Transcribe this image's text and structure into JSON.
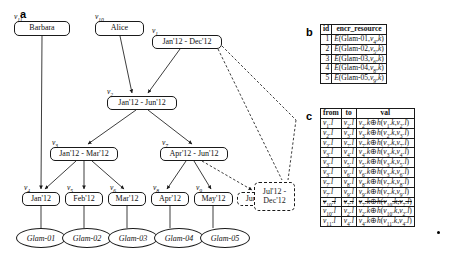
{
  "figure": {
    "panels": [
      "a",
      "b",
      "c"
    ]
  },
  "panel_a": {
    "letter": "a",
    "nodes": [
      {
        "id": "n-barbara",
        "label": "Barbara",
        "vlabel": "v",
        "vsub": "11",
        "x": 14,
        "y": 21,
        "w": 56,
        "h": 15,
        "style": "solid"
      },
      {
        "id": "n-alice",
        "label": "Alice",
        "vlabel": "v",
        "vsub": "10",
        "x": 95,
        "y": 21,
        "w": 49,
        "h": 15,
        "style": "solid"
      },
      {
        "id": "n-v1",
        "label": "Jan'12 - Dec'12",
        "vlabel": "v",
        "vsub": "1",
        "x": 152,
        "y": 35,
        "w": 70,
        "h": 14,
        "style": "solid"
      },
      {
        "id": "n-v2",
        "label": "Jan'12 - Jun'12",
        "vlabel": "v",
        "vsub": "2",
        "x": 107,
        "y": 96,
        "w": 70,
        "h": 14,
        "style": "solid"
      },
      {
        "id": "n-v3",
        "label": "Jan'12 - Mar'12",
        "vlabel": "v",
        "vsub": "3",
        "x": 50,
        "y": 147,
        "w": 68,
        "h": 14,
        "style": "solid"
      },
      {
        "id": "n-v7",
        "label": "Apr'12 - Jun'12",
        "vlabel": "v",
        "vsub": "7",
        "x": 160,
        "y": 147,
        "w": 68,
        "h": 14,
        "style": "solid"
      },
      {
        "id": "n-v4",
        "label": "Jan'12",
        "vlabel": "v",
        "vsub": "4",
        "x": 22,
        "y": 192,
        "w": 38,
        "h": 14,
        "style": "solid"
      },
      {
        "id": "n-v5",
        "label": "Feb'12",
        "vlabel": "v",
        "vsub": "5",
        "x": 65,
        "y": 192,
        "w": 38,
        "h": 14,
        "style": "solid"
      },
      {
        "id": "n-v6",
        "label": "Mar'12",
        "vlabel": "v",
        "vsub": "6",
        "x": 108,
        "y": 192,
        "w": 38,
        "h": 14,
        "style": "solid"
      },
      {
        "id": "n-v8",
        "label": "Apr'12",
        "vlabel": "v",
        "vsub": "8",
        "x": 151,
        "y": 192,
        "w": 38,
        "h": 14,
        "style": "solid"
      },
      {
        "id": "n-v9",
        "label": "May'12",
        "vlabel": "v",
        "vsub": "9",
        "x": 194,
        "y": 192,
        "w": 39,
        "h": 14,
        "style": "solid"
      },
      {
        "id": "n-jun",
        "label": "Jun'12",
        "vlabel": "",
        "vsub": "",
        "x": 237,
        "y": 192,
        "w": 38,
        "h": 14,
        "style": "dashed"
      },
      {
        "id": "n-jul-dec",
        "label": "Jul'12 - Dec'12",
        "vlabel": "",
        "vsub": "",
        "x": 254,
        "y": 182,
        "w": 41,
        "h": 29,
        "style": "dashed"
      }
    ],
    "resources": [
      {
        "id": "r1",
        "label": "Glam-01",
        "x": 16,
        "y": 228,
        "w": 50,
        "h": 20
      },
      {
        "id": "r2",
        "label": "Glam-02",
        "x": 62,
        "y": 228,
        "w": 50,
        "h": 20
      },
      {
        "id": "r3",
        "label": "Glam-03",
        "x": 108,
        "y": 228,
        "w": 50,
        "h": 20
      },
      {
        "id": "r4",
        "label": "Glam-04",
        "x": 154,
        "y": 228,
        "w": 50,
        "h": 20
      },
      {
        "id": "r5",
        "label": "Glam-05",
        "x": 200,
        "y": 228,
        "w": 50,
        "h": 20
      }
    ]
  },
  "panel_b": {
    "letter": "b",
    "title": "encr_resource table",
    "columns": [
      "id",
      "encr_resource"
    ],
    "rows": [
      {
        "id": "1",
        "fn": "E",
        "res": "Glam-01",
        "v": "v",
        "vsub": "4",
        "k": "k"
      },
      {
        "id": "2",
        "fn": "E",
        "res": "Glam-02",
        "v": "v",
        "vsub": "5",
        "k": "k"
      },
      {
        "id": "3",
        "fn": "E",
        "res": "Glam-03",
        "v": "v",
        "vsub": "6",
        "k": "k"
      },
      {
        "id": "4",
        "fn": "E",
        "res": "Glam-04",
        "v": "v",
        "vsub": "8",
        "k": "k"
      },
      {
        "id": "5",
        "fn": "E",
        "res": "Glam-05",
        "v": "v",
        "vsub": "9",
        "k": "k"
      }
    ]
  },
  "panel_c": {
    "letter": "c",
    "title": "token table",
    "columns": [
      "from",
      "to",
      "val"
    ],
    "rows": [
      {
        "from": "v",
        "from_sub": "1",
        "from_suffix": ".l",
        "to": "v",
        "to_sub": "2",
        "to_suffix": ".l",
        "val_a": "v",
        "val_a_sub": "2",
        "val_a_suffix": ".k",
        "op": "⊕",
        "val_h": "h",
        "h1": "v",
        "h1_sub": "1",
        "h1_suffix": ".k",
        "h2": "v",
        "h2_sub": "2",
        "h2_suffix": ".l",
        "struck": false,
        "bullet": false
      },
      {
        "from": "v",
        "from_sub": "2",
        "from_suffix": ".l",
        "to": "v",
        "to_sub": "3",
        "to_suffix": ".l",
        "val_a": "v",
        "val_a_sub": "3",
        "val_a_suffix": ".k",
        "op": "⊕",
        "val_h": "h",
        "h1": "v",
        "h1_sub": "2",
        "h1_suffix": ".k",
        "h2": "v",
        "h2_sub": "3",
        "h2_suffix": ".l",
        "struck": false,
        "bullet": false
      },
      {
        "from": "v",
        "from_sub": "2",
        "from_suffix": ".l",
        "to": "v",
        "to_sub": "7",
        "to_suffix": ".l",
        "val_a": "v",
        "val_a_sub": "7",
        "val_a_suffix": ".k",
        "op": "⊕",
        "val_h": "h",
        "h1": "v",
        "h1_sub": "2",
        "h1_suffix": ".k",
        "h2": "v",
        "h2_sub": "7",
        "h2_suffix": ".l",
        "struck": false,
        "bullet": false
      },
      {
        "from": "v",
        "from_sub": "3",
        "from_suffix": ".l",
        "to": "v",
        "to_sub": "4",
        "to_suffix": ".l",
        "val_a": "v",
        "val_a_sub": "4",
        "val_a_suffix": ".k",
        "op": "⊕",
        "val_h": "h",
        "h1": "v",
        "h1_sub": "3",
        "h1_suffix": ".k",
        "h2": "v",
        "h2_sub": "4",
        "h2_suffix": ".l",
        "struck": false,
        "bullet": false
      },
      {
        "from": "v",
        "from_sub": "3",
        "from_suffix": ".l",
        "to": "v",
        "to_sub": "5",
        "to_suffix": ".l",
        "val_a": "v",
        "val_a_sub": "5",
        "val_a_suffix": ".k",
        "op": "⊕",
        "val_h": "h",
        "h1": "v",
        "h1_sub": "3",
        "h1_suffix": ".k",
        "h2": "v",
        "h2_sub": "5",
        "h2_suffix": ".l",
        "struck": false,
        "bullet": false
      },
      {
        "from": "v",
        "from_sub": "3",
        "from_suffix": ".l",
        "to": "v",
        "to_sub": "6",
        "to_suffix": ".l",
        "val_a": "v",
        "val_a_sub": "6",
        "val_a_suffix": ".k",
        "op": "⊕",
        "val_h": "h",
        "h1": "v",
        "h1_sub": "3",
        "h1_suffix": ".k",
        "h2": "v",
        "h2_sub": "6",
        "h2_suffix": ".l",
        "struck": false,
        "bullet": false
      },
      {
        "from": "v",
        "from_sub": "7",
        "from_suffix": ".l",
        "to": "v",
        "to_sub": "8",
        "to_suffix": ".l",
        "val_a": "v",
        "val_a_sub": "8",
        "val_a_suffix": ".k",
        "op": "⊕",
        "val_h": "h",
        "h1": "v",
        "h1_sub": "7",
        "h1_suffix": ".k",
        "h2": "v",
        "h2_sub": "8",
        "h2_suffix": ".l",
        "struck": false,
        "bullet": false
      },
      {
        "from": "v",
        "from_sub": "7",
        "from_suffix": ".l",
        "to": "v",
        "to_sub": "9",
        "to_suffix": ".l",
        "val_a": "v",
        "val_a_sub": "9",
        "val_a_suffix": ".k",
        "op": "⊕",
        "val_h": "h",
        "h1": "v",
        "h1_sub": "7",
        "h1_suffix": ".k",
        "h2": "v",
        "h2_sub": "9",
        "h2_suffix": ".l",
        "struck": false,
        "bullet": false
      },
      {
        "from": "v",
        "from_sub": "10",
        "from_suffix": ".l",
        "to": "v",
        "to_sub": "7",
        "to_suffix": ".l",
        "val_a": "v",
        "val_a_sub": "7",
        "val_a_suffix": ".k",
        "op": "⊕",
        "val_h": "h",
        "h1": "v",
        "h1_sub": "10",
        "h1_suffix": ".k",
        "h2": "v",
        "h2_sub": "7",
        "h2_suffix": ".l",
        "struck": true,
        "bullet": false
      },
      {
        "from": "v",
        "from_sub": "10",
        "from_suffix": ".l",
        "to": "v",
        "to_sub": "2",
        "to_suffix": ".l",
        "val_a": "v",
        "val_a_sub": "2",
        "val_a_suffix": ".k",
        "op": "⊕",
        "val_h": "h",
        "h1": "v",
        "h1_sub": "10",
        "h1_suffix": ".k",
        "h2": "v",
        "h2_sub": "2",
        "h2_suffix": ".l",
        "struck": false,
        "bullet": true
      },
      {
        "from": "v",
        "from_sub": "11",
        "from_suffix": ".l",
        "to": "v",
        "to_sub": "4",
        "to_suffix": ".l",
        "val_a": "v",
        "val_a_sub": "4",
        "val_a_suffix": ".k",
        "op": "⊕",
        "val_h": "h",
        "h1": "v",
        "h1_sub": "11",
        "h1_suffix": ".k",
        "h2": "v",
        "h2_sub": "4",
        "h2_suffix": ".l",
        "struck": false,
        "bullet": false
      }
    ]
  },
  "colors": {
    "stroke": "#1a1a1a",
    "background": "#ffffff",
    "text": "#111111"
  }
}
